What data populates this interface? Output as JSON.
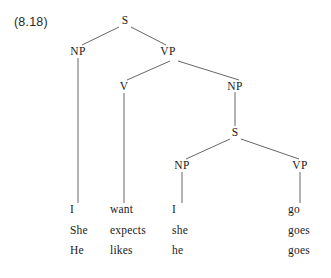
{
  "figure": {
    "example_number": "(8.18)",
    "ink_color": "#1a1a1a",
    "line_color": "#555555",
    "background_color": "#ffffff"
  },
  "nodes": [
    {
      "label": "S",
      "name": "node-s-root",
      "x": 125,
      "y": 21
    },
    {
      "label": "NP",
      "name": "node-np-subject",
      "x": 78,
      "y": 52
    },
    {
      "label": "VP",
      "name": "node-vp-matrix",
      "x": 168,
      "y": 52
    },
    {
      "label": "V",
      "name": "node-v-matrix",
      "x": 124,
      "y": 87
    },
    {
      "label": "NP",
      "name": "node-np-object",
      "x": 235,
      "y": 87
    },
    {
      "label": "S",
      "name": "node-s-embedded",
      "x": 235,
      "y": 133
    },
    {
      "label": "NP",
      "name": "node-np-embedded",
      "x": 182,
      "y": 166
    },
    {
      "label": "VP",
      "name": "node-vp-embedded",
      "x": 300,
      "y": 166
    }
  ],
  "edges": [
    {
      "name": "edge-s-to-np-subject",
      "x1": 119,
      "y1": 27,
      "x2": 82,
      "y2": 45
    },
    {
      "name": "edge-s-to-vp-matrix",
      "x1": 131,
      "y1": 27,
      "x2": 166,
      "y2": 45
    },
    {
      "name": "edge-vp-to-v",
      "x1": 170,
      "y1": 61,
      "x2": 127,
      "y2": 80
    },
    {
      "name": "edge-vp-to-np-object",
      "x1": 178,
      "y1": 61,
      "x2": 239,
      "y2": 80
    },
    {
      "name": "edge-np-object-to-s",
      "x1": 235,
      "y1": 92,
      "x2": 235,
      "y2": 126
    },
    {
      "name": "edge-s-to-np-embedded",
      "x1": 230,
      "y1": 139,
      "x2": 186,
      "y2": 159
    },
    {
      "name": "edge-s-to-vp-embedded",
      "x1": 241,
      "y1": 139,
      "x2": 299,
      "y2": 159
    },
    {
      "name": "stem-np-subject",
      "x1": 78,
      "y1": 58,
      "x2": 78,
      "y2": 203
    },
    {
      "name": "stem-v-matrix",
      "x1": 124,
      "y1": 93,
      "x2": 124,
      "y2": 203
    },
    {
      "name": "stem-np-embedded",
      "x1": 182,
      "y1": 172,
      "x2": 182,
      "y2": 203
    },
    {
      "name": "stem-vp-embedded",
      "x1": 300,
      "y1": 172,
      "x2": 300,
      "y2": 203
    }
  ],
  "terminals": {
    "row_y": [
      211,
      232,
      252
    ],
    "columns": [
      {
        "name": "terminal-column-subject",
        "x": 70,
        "words": [
          "I",
          "She",
          "He"
        ]
      },
      {
        "name": "terminal-column-verb",
        "x": 110,
        "words": [
          "want",
          "expects",
          "likes"
        ]
      },
      {
        "name": "terminal-column-embedded-subject",
        "x": 172,
        "words": [
          "I",
          "she",
          "he"
        ]
      },
      {
        "name": "terminal-column-embedded-verb",
        "x": 288,
        "words": [
          "go",
          "goes",
          "goes"
        ]
      }
    ]
  },
  "sentences": [
    "I want I go",
    "She expects she goes",
    "He likes he goes"
  ]
}
